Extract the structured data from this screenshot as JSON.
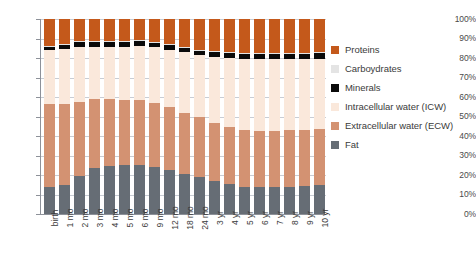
{
  "chart_data": {
    "type": "bar",
    "subtype": "stacked-percentage",
    "title": "",
    "xlabel": "",
    "ylabel": "",
    "ylim": [
      0,
      100
    ],
    "y_unit": "%",
    "grid": true,
    "legend_position": "right",
    "y_ticks": [
      "0%",
      "10%",
      "20%",
      "30%",
      "40%",
      "50%",
      "60%",
      "70%",
      "80%",
      "90%",
      "100%"
    ],
    "y_tick_values": [
      0,
      10,
      20,
      30,
      40,
      50,
      60,
      70,
      80,
      90,
      100
    ],
    "categories": [
      "birth",
      "1 mo",
      "2 mo",
      "3 mo",
      "4 mo",
      "5 mo",
      "6 mo",
      "9 mo",
      "12 mo",
      "18 mo",
      "24 mo",
      "3 yr",
      "4 yr",
      "5 yr",
      "6 yr",
      "7 yr",
      "8 yr",
      "9 yr",
      "10 yr"
    ],
    "series": [
      {
        "name": "Fat",
        "color": "#666d75",
        "values": [
          14.0,
          15.0,
          19.5,
          23.5,
          24.5,
          25.3,
          25.3,
          24.0,
          22.5,
          20.5,
          19.0,
          16.8,
          15.2,
          14.0,
          13.7,
          13.8,
          14.0,
          14.3,
          15.0
        ]
      },
      {
        "name": "Extracellular water (ECW)",
        "color": "#d39272",
        "values": [
          42.5,
          41.3,
          37.8,
          35.3,
          34.3,
          33.4,
          33.2,
          32.8,
          32.2,
          31.5,
          30.8,
          30.0,
          29.5,
          29.2,
          29.1,
          29.0,
          28.9,
          28.8,
          28.7
        ]
      },
      {
        "name": "Intracellular water (ICW)",
        "color": "#fae8db",
        "values": [
          27.5,
          28.3,
          28.4,
          26.9,
          27.1,
          27.2,
          27.6,
          28.6,
          29.6,
          31.1,
          31.6,
          33.8,
          35.4,
          36.4,
          36.8,
          36.8,
          36.7,
          36.5,
          35.9
        ]
      },
      {
        "name": "Minerals",
        "color": "#0a0a0a",
        "values": [
          2.0,
          2.0,
          2.5,
          2.5,
          2.6,
          2.6,
          2.6,
          2.5,
          2.3,
          2.4,
          2.3,
          2.5,
          2.5,
          2.6,
          2.6,
          2.7,
          2.7,
          2.8,
          2.9
        ]
      },
      {
        "name": "Carboydrates",
        "color": "#e4e4e4",
        "values": [
          0.4,
          0.4,
          0.4,
          0.4,
          0.4,
          0.4,
          0.4,
          0.4,
          0.4,
          0.4,
          0.4,
          0.4,
          0.4,
          0.4,
          0.4,
          0.4,
          0.4,
          0.4,
          0.4
        ]
      },
      {
        "name": "Proteins",
        "color": "#c4591b",
        "values": [
          13.6,
          13.0,
          11.4,
          11.4,
          11.1,
          11.1,
          10.9,
          11.7,
          13.0,
          14.1,
          15.9,
          16.5,
          17.0,
          17.4,
          17.4,
          17.3,
          17.3,
          17.2,
          17.1
        ]
      }
    ]
  },
  "legend": {
    "items": [
      {
        "label": "Proteins",
        "color": "#c4591b"
      },
      {
        "label": "Carboydrates",
        "color": "#e4e4e4"
      },
      {
        "label": "Minerals",
        "color": "#0a0a0a"
      },
      {
        "label": "Intracellular water (ICW)",
        "color": "#fae8db"
      },
      {
        "label": "Extracellular water (ECW)",
        "color": "#d39272"
      },
      {
        "label": "Fat",
        "color": "#666d75"
      }
    ]
  }
}
